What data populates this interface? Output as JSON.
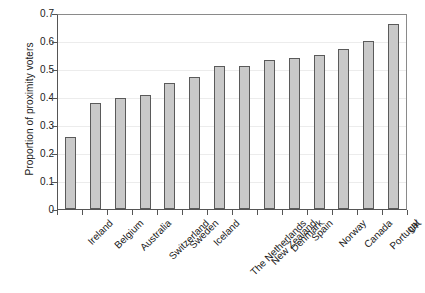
{
  "chart_data": {
    "type": "bar",
    "title": "",
    "xlabel": "",
    "ylabel": "Proportion of proximity voters",
    "ylim": [
      0,
      0.7
    ],
    "ytick_labels": [
      "0",
      "0.1",
      "0.2",
      "0.3",
      "0.4",
      "0.5",
      "0.6",
      "0.7"
    ],
    "ytick_values": [
      0,
      0.1,
      0.2,
      0.3,
      0.4,
      0.5,
      0.6,
      0.7
    ],
    "grid": true,
    "legend": false,
    "bar_color": "#c9c9c9",
    "bar_edge_color": "#5a5a5a",
    "categories": [
      "Ireland",
      "Belgium",
      "Australia",
      "Switzerland",
      "Sweden",
      "Iceland",
      "The Netherlands",
      "New Zealand",
      "Denmark",
      "Spain",
      "Norway",
      "Canada",
      "Portugal",
      "UK"
    ],
    "values": [
      0.256,
      0.378,
      0.396,
      0.406,
      0.451,
      0.473,
      0.509,
      0.511,
      0.531,
      0.539,
      0.549,
      0.573,
      0.6,
      0.659
    ]
  }
}
